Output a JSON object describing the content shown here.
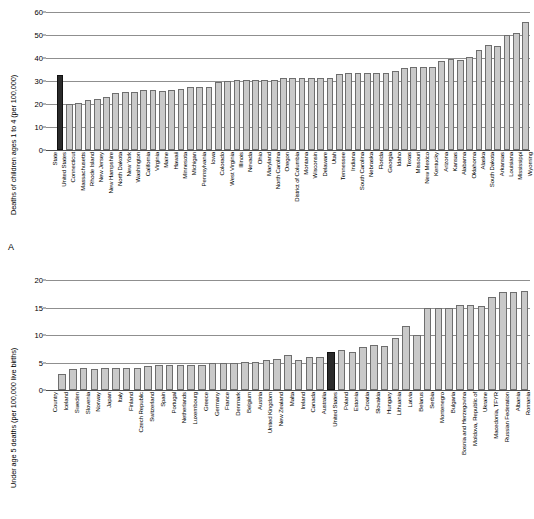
{
  "figure": {
    "panelA_letter": "A",
    "panelB_letter": "B"
  },
  "chart_data": [
    {
      "panel": "A",
      "type": "bar",
      "title": "",
      "xlabel": "",
      "ylabel": "Deaths of children ages 1 to 4 (per 100,000)",
      "ylim": [
        0,
        60
      ],
      "yticks": [
        0,
        10,
        20,
        30,
        40,
        50,
        60
      ],
      "grid": true,
      "legend": "none",
      "axis_placeholder_label": "State",
      "highlight_category": "United States",
      "highlight_color": "#2b2b2b",
      "bar_color": "#c9c9c9",
      "categories": [
        "State",
        "United States",
        "Connecticut",
        "Massachusetts",
        "Rhode Island",
        "New Jersey",
        "New Hampshire",
        "North Dakota",
        "New York",
        "Washington",
        "California",
        "Virginia",
        "Maine",
        "Hawaii",
        "Minnesota",
        "Michigan",
        "Pennsylvania",
        "Iowa",
        "Colorado",
        "West Virginia",
        "Illinois",
        "Nevada",
        "Ohio",
        "Maryland",
        "North Carolina",
        "Oregon",
        "District of Columbia",
        "Montana",
        "Wisconsin",
        "Delaware",
        "Utah",
        "Tennessee",
        "Indiana",
        "South Carolina",
        "Nebraska",
        "Florida",
        "Georgia",
        "Idaho",
        "Texas",
        "Missouri",
        "New Mexico",
        "Kentucky",
        "Arizona",
        "Kansas",
        "Alabama",
        "Oklahoma",
        "Alaska",
        "South Dakota",
        "Arkansas",
        "Louisiana",
        "Mississippi",
        "Wyoming"
      ],
      "values": [
        null,
        32.5,
        20.1,
        20.6,
        21.6,
        22.3,
        23.1,
        24.8,
        25.4,
        25.4,
        26.0,
        25.9,
        25.6,
        26.1,
        26.7,
        27.2,
        27.3,
        27.5,
        29.5,
        30.0,
        30.3,
        30.4,
        30.4,
        30.5,
        30.6,
        31.4,
        31.2,
        31.4,
        31.4,
        31.3,
        31.3,
        33.2,
        33.3,
        33.3,
        33.3,
        33.3,
        33.4,
        34.4,
        35.7,
        36.0,
        36.1,
        36.3,
        38.6,
        39.4,
        39.2,
        40.3,
        43.5,
        45.6,
        45.3,
        49.8,
        51.0,
        55.5
      ]
    },
    {
      "panel": "B",
      "type": "bar",
      "title": "",
      "xlabel": "",
      "ylabel": "Under age 5 deaths (per 100,000 live births)",
      "ylim": [
        0,
        20
      ],
      "yticks": [
        0,
        5,
        10,
        15,
        20
      ],
      "grid": true,
      "legend": "none",
      "axis_placeholder_label": "Country",
      "highlight_category": "United States",
      "highlight_color": "#2b2b2b",
      "bar_color": "#c9c9c9",
      "categories": [
        "Country",
        "Iceland",
        "Sweden",
        "Slovenia",
        "Norway",
        "Japan",
        "Italy",
        "Finland",
        "Czech Republic",
        "Switzerland",
        "Spain",
        "Portugal",
        "Netherlands",
        "Luxembourg",
        "Greece",
        "Germany",
        "France",
        "Denmark",
        "Belgium",
        "Austria",
        "United Kingdom",
        "New Zealand",
        "Malta",
        "Ireland",
        "Canada",
        "Australia",
        "United States",
        "Poland",
        "Estonia",
        "Croatia",
        "Slovakia",
        "Hungary",
        "Lithuania",
        "Latvia",
        "Belarus",
        "Serbia",
        "Montenegro",
        "Bulgaria",
        "Bosnia and Herzegovina",
        "Moldova, Republic of",
        "Ukraine",
        "Macedonia, TFYR",
        "Russian Federation",
        "Albania",
        "Romania"
      ],
      "values": [
        null,
        3.0,
        3.9,
        4.0,
        3.9,
        4.0,
        4.0,
        4.0,
        4.0,
        4.4,
        4.5,
        4.5,
        4.6,
        4.6,
        4.6,
        5.0,
        5.0,
        5.0,
        5.1,
        5.1,
        5.5,
        5.6,
        6.3,
        5.5,
        6.0,
        6.0,
        7.0,
        7.3,
        7.0,
        7.8,
        8.2,
        8.0,
        9.4,
        11.6,
        10.0,
        15.0,
        15.0,
        15.0,
        15.5,
        15.4,
        15.3,
        17.0,
        17.8,
        17.8,
        18.0,
        19.3
      ]
    }
  ]
}
